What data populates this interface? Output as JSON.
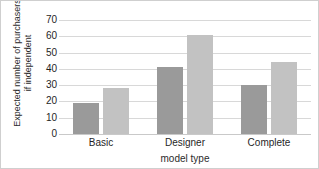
{
  "chart_data": {
    "type": "bar",
    "title": "",
    "subtitle": "",
    "xlabel": "model type",
    "ylabel": "Expected number of purchasers if independent",
    "ylabel_lines": [
      "Expected number of purchasers",
      "if independent"
    ],
    "categories": [
      "Basic",
      "Designer",
      "Complete"
    ],
    "series": [
      {
        "name": "series-1",
        "color": "#9a9a9a",
        "values": [
          19,
          41,
          30
        ]
      },
      {
        "name": "series-2",
        "color": "#c2c2c2",
        "values": [
          28,
          61,
          44
        ]
      }
    ],
    "ylim": [
      0,
      70
    ],
    "ytick_values": [
      0,
      10,
      20,
      30,
      40,
      50,
      60,
      70
    ],
    "ytick_labels": [
      "0",
      "10",
      "20",
      "30",
      "40",
      "50",
      "60",
      "70"
    ],
    "grid": true,
    "grid_axis": "y",
    "legend": false,
    "legend_position": "none",
    "frame": true
  },
  "colors": {
    "background": "#ffffff",
    "frame": "#cfcfcf",
    "gridline": "#d8d8d8",
    "baseline": "#c9c9c9",
    "text": "#1f1f1f",
    "bar_dark": "#9a9a9a",
    "bar_light": "#c2c2c2"
  }
}
